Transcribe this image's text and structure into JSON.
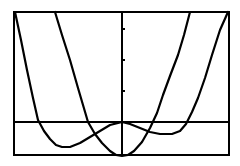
{
  "chart_data": {
    "type": "line",
    "title": "",
    "xlabel": "",
    "ylabel": "",
    "grid": false,
    "legend": "none",
    "frame": {
      "left": 14,
      "top": 12,
      "right": 229,
      "bottom": 155
    },
    "axes": {
      "x_axis_y": 122,
      "y_axis_x": 122
    },
    "y_ticks_px": [
      29,
      60,
      91
    ],
    "series": [
      {
        "name": "quartic-w-curve",
        "color": "#000000",
        "points_px": [
          [
            15,
            12
          ],
          [
            21,
            40
          ],
          [
            27,
            70
          ],
          [
            33,
            98
          ],
          [
            38,
            120
          ],
          [
            44,
            131
          ],
          [
            50,
            139
          ],
          [
            56,
            145
          ],
          [
            62,
            147
          ],
          [
            70,
            147
          ],
          [
            80,
            143
          ],
          [
            90,
            137
          ],
          [
            100,
            131
          ],
          [
            110,
            125
          ],
          [
            122,
            122
          ],
          [
            130,
            124
          ],
          [
            140,
            128
          ],
          [
            150,
            132
          ],
          [
            160,
            134
          ],
          [
            172,
            134
          ],
          [
            180,
            131
          ],
          [
            186,
            124
          ],
          [
            192,
            112
          ],
          [
            198,
            98
          ],
          [
            205,
            78
          ],
          [
            212,
            55
          ],
          [
            220,
            30
          ],
          [
            228,
            12
          ]
        ]
      },
      {
        "name": "parabola-u-curve",
        "color": "#000000",
        "points_px": [
          [
            55,
            12
          ],
          [
            62,
            35
          ],
          [
            70,
            60
          ],
          [
            78,
            88
          ],
          [
            88,
            122
          ],
          [
            95,
            134
          ],
          [
            102,
            143
          ],
          [
            110,
            151
          ],
          [
            116,
            155
          ],
          [
            122,
            156
          ],
          [
            128,
            155
          ],
          [
            134,
            151
          ],
          [
            142,
            142
          ],
          [
            150,
            128
          ],
          [
            157,
            113
          ],
          [
            163,
            95
          ],
          [
            170,
            76
          ],
          [
            178,
            55
          ],
          [
            184,
            35
          ],
          [
            190,
            12
          ]
        ]
      }
    ]
  },
  "colors": {
    "background": "#ffffff",
    "ink": "#000000"
  }
}
